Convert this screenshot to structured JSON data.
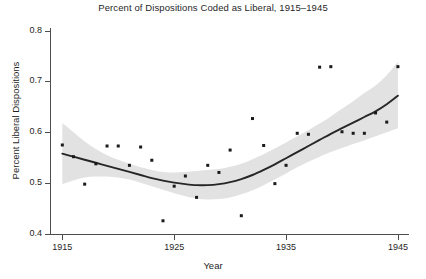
{
  "chart_data": {
    "type": "scatter",
    "title_display": "Percent of Dispositions Coded as Liberal, 1915–1945",
    "xlabel": "Year",
    "ylabel": "Percent Liberal Dispositions",
    "xlim": [
      1913.9,
      1945.9
    ],
    "ylim": [
      0.4,
      0.805
    ],
    "xticks": [
      1915,
      1925,
      1935,
      1945
    ],
    "xtick_labels": [
      "1915",
      "1925",
      "1935",
      "1945"
    ],
    "yticks": [
      0.4,
      0.5,
      0.6,
      0.7,
      0.8
    ],
    "ytick_labels": [
      "0.4",
      "0.5",
      "0.6",
      "0.7",
      "0.8"
    ],
    "grid": false,
    "legend": "none",
    "point_color": "#1a1a1a",
    "line_color": "#262626",
    "band_color": "#e2e2e2",
    "background": "#ffffff",
    "axis_color": "#4d4d4d",
    "x": [
      1915,
      1916,
      1917,
      1918,
      1919,
      1920,
      1921,
      1922,
      1923,
      1924,
      1925,
      1926,
      1927,
      1928,
      1929,
      1930,
      1931,
      1932,
      1933,
      1934,
      1935,
      1936,
      1937,
      1938,
      1939,
      1940,
      1941,
      1942,
      1943,
      1944,
      1945
    ],
    "y": [
      0.575,
      0.552,
      0.498,
      0.538,
      0.573,
      0.573,
      0.535,
      0.571,
      0.545,
      0.426,
      0.494,
      0.514,
      0.472,
      0.535,
      0.521,
      0.565,
      0.436,
      0.627,
      0.574,
      0.499,
      0.535,
      0.598,
      0.596,
      0.728,
      0.729,
      0.601,
      0.598,
      0.598,
      0.638,
      0.62,
      0.729
    ],
    "series": [
      {
        "name": "Observed percent liberal",
        "type": "scatter",
        "values": [
          0.575,
          0.552,
          0.498,
          0.538,
          0.573,
          0.573,
          0.535,
          0.571,
          0.545,
          0.426,
          0.494,
          0.514,
          0.472,
          0.535,
          0.521,
          0.565,
          0.436,
          0.627,
          0.574,
          0.499,
          0.535,
          0.598,
          0.596,
          0.728,
          0.729,
          0.601,
          0.598,
          0.598,
          0.638,
          0.62,
          0.729
        ]
      },
      {
        "name": "Smoothed trend (loess)",
        "type": "line",
        "x": [
          1915,
          1916,
          1917,
          1918,
          1919,
          1920,
          1921,
          1922,
          1923,
          1924,
          1925,
          1926,
          1927,
          1928,
          1929,
          1930,
          1931,
          1932,
          1933,
          1934,
          1935,
          1936,
          1937,
          1938,
          1939,
          1940,
          1941,
          1942,
          1943,
          1944,
          1945
        ],
        "values": [
          0.558,
          0.552,
          0.546,
          0.54,
          0.534,
          0.528,
          0.522,
          0.516,
          0.51,
          0.505,
          0.501,
          0.498,
          0.496,
          0.496,
          0.498,
          0.502,
          0.508,
          0.516,
          0.526,
          0.537,
          0.549,
          0.561,
          0.573,
          0.585,
          0.597,
          0.608,
          0.619,
          0.63,
          0.641,
          0.655,
          0.672
        ],
        "band_lower": [
          0.498,
          0.505,
          0.511,
          0.513,
          0.513,
          0.511,
          0.507,
          0.501,
          0.494,
          0.487,
          0.48,
          0.474,
          0.47,
          0.468,
          0.469,
          0.472,
          0.478,
          0.486,
          0.496,
          0.507,
          0.519,
          0.531,
          0.542,
          0.552,
          0.561,
          0.569,
          0.577,
          0.584,
          0.592,
          0.6,
          0.608
        ],
        "band_upper": [
          0.618,
          0.6,
          0.582,
          0.567,
          0.555,
          0.546,
          0.538,
          0.531,
          0.526,
          0.522,
          0.521,
          0.522,
          0.524,
          0.526,
          0.528,
          0.532,
          0.538,
          0.547,
          0.557,
          0.568,
          0.58,
          0.592,
          0.604,
          0.617,
          0.631,
          0.646,
          0.661,
          0.677,
          0.692,
          0.712,
          0.738
        ]
      }
    ]
  }
}
